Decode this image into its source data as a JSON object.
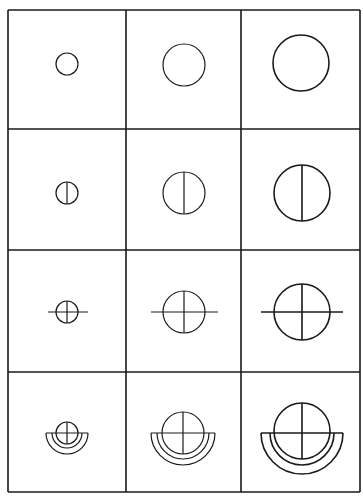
{
  "diagram": {
    "title": "",
    "rows": 4,
    "cols": 3,
    "stroke_color": "#1a1a1a",
    "background": "#ffffff",
    "grid": {
      "x_lines": [
        8,
        126,
        241,
        360
      ],
      "y_lines": [
        10,
        129,
        250,
        372,
        492
      ]
    },
    "row_descriptions": [
      "circle",
      "circle with vertical line",
      "circle with cross extending horizontally",
      "circle with cross over half-ring bowl"
    ],
    "cells": [
      {
        "row": 0,
        "col": 0,
        "cx": 67,
        "cy": 64,
        "r": 11,
        "type": "circle"
      },
      {
        "row": 0,
        "col": 1,
        "cx": 184,
        "cy": 65,
        "r": 21,
        "type": "circle"
      },
      {
        "row": 0,
        "col": 2,
        "cx": 301,
        "cy": 63,
        "r": 28,
        "type": "circle"
      },
      {
        "row": 1,
        "col": 0,
        "cx": 67,
        "cy": 193,
        "r": 11,
        "type": "circle-vline"
      },
      {
        "row": 1,
        "col": 1,
        "cx": 184,
        "cy": 193,
        "r": 21,
        "type": "circle-vline"
      },
      {
        "row": 1,
        "col": 2,
        "cx": 302,
        "cy": 193,
        "r": 28,
        "type": "circle-vline"
      },
      {
        "row": 2,
        "col": 0,
        "cx": 67,
        "cy": 312,
        "r": 11,
        "type": "circle-cross-h",
        "hx1": 48,
        "hx2": 88
      },
      {
        "row": 2,
        "col": 1,
        "cx": 184,
        "cy": 312,
        "r": 21,
        "type": "circle-cross-h",
        "hx1": 151,
        "hx2": 218
      },
      {
        "row": 2,
        "col": 2,
        "cx": 302,
        "cy": 312,
        "r": 28,
        "type": "circle-cross-h",
        "hx1": 261,
        "hx2": 343
      },
      {
        "row": 3,
        "col": 0,
        "cx": 67,
        "cy": 433,
        "r": 11,
        "type": "circle-cross-bowl",
        "bowl_outer": 21,
        "bowl_inner": 15,
        "bowl_y": 433
      },
      {
        "row": 3,
        "col": 1,
        "cx": 183,
        "cy": 433,
        "r": 21,
        "type": "circle-cross-bowl",
        "bowl_outer": 32,
        "bowl_inner": 26,
        "bowl_y": 433
      },
      {
        "row": 3,
        "col": 2,
        "cx": 302,
        "cy": 431,
        "r": 28,
        "type": "circle-cross-bowl",
        "bowl_outer": 41,
        "bowl_inner": 32,
        "bowl_y": 433
      }
    ]
  }
}
